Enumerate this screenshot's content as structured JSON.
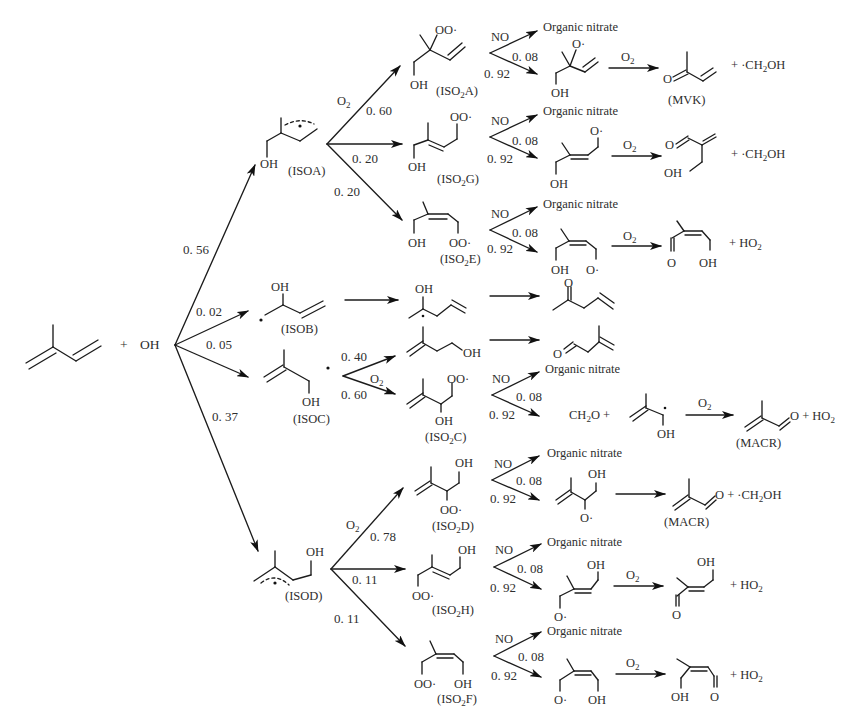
{
  "diagram": {
    "reactants": {
      "isoprene": "isoprene",
      "plus": "+",
      "oxidant": "OH"
    },
    "first_branch": [
      {
        "label": "ISOA",
        "yield": "0.56"
      },
      {
        "label": "ISOB",
        "yield": "0.02"
      },
      {
        "label": "ISOC",
        "yield": "0.05"
      },
      {
        "label": "ISOD",
        "yield": "0.37"
      }
    ],
    "isoa_branch": {
      "reagent": "O2",
      "paths": [
        {
          "peroxy": "ISO2A",
          "yield": "0.60"
        },
        {
          "peroxy": "ISO2G",
          "yield": "0.20"
        },
        {
          "peroxy": "ISO2E",
          "yield": "0.20"
        }
      ]
    },
    "isoc_branch": {
      "reagent": "O2",
      "paths": [
        {
          "product": "3-methyl-3-buten-1-ol-like aldehyde route",
          "yield": "0.40"
        },
        {
          "peroxy": "ISO2C",
          "yield": "0.60"
        }
      ]
    },
    "isod_branch": {
      "reagent": "O2",
      "paths": [
        {
          "peroxy": "ISO2D",
          "yield": "0.78"
        },
        {
          "peroxy": "ISO2H",
          "yield": "0.11"
        },
        {
          "peroxy": "ISO2F",
          "yield": "0.11"
        }
      ]
    },
    "no_step": {
      "reagent": "NO",
      "nitrate_label": "Organic nitrate",
      "nitrate_yield": "0.08",
      "alkoxy_yield": "0.92"
    },
    "labels": {
      "isoa": "(ISOA)",
      "isob": "(ISOB)",
      "isoc": "(ISOC)",
      "isod": "(ISOD)",
      "iso2a": "(ISO",
      "iso2a_tail": "A)",
      "iso2g_tail": "G)",
      "iso2e_tail": "E)",
      "iso2c_tail": "C)",
      "iso2d_tail": "D)",
      "iso2h_tail": "H)",
      "iso2f_tail": "F)",
      "mvk": "(MVK)",
      "macr": "(MACR)",
      "macr2": "(MACR)",
      "sub2": "2",
      "o2": "O",
      "oh": "OH",
      "oo_dot": "OO·",
      "o_dot": "O·",
      "o": "O",
      "ch2oh_radical": "+ ·CH",
      "ch2oh_tail": "OH",
      "ho2": "+ HO",
      "ho2b": "+  HO",
      "ch2o": "CH",
      "ch2o_tail": "O +",
      "plus_o_ho2": "O + HO",
      "plus_ch2oh_macr": "O + ·CH",
      "no": "NO",
      "organic_nitrate": "Organic nitrate",
      "y008": "0. 08",
      "y092": "0. 92",
      "y056": "0. 56",
      "y002": "0. 02",
      "y005": "0. 05",
      "y037": "0. 37",
      "y060": "0. 60",
      "y020a": "0. 20",
      "y020b": "0. 20",
      "y040": "0. 40",
      "y060c": "0. 60",
      "y078": "0. 78",
      "y011a": "0. 11",
      "y011b": "0. 11",
      "plus": "+",
      "oh_reactant": "OH"
    },
    "final_products": [
      {
        "from": "ISO2A",
        "products": [
          "MVK",
          "·CH2OH"
        ]
      },
      {
        "from": "ISO2G",
        "products": [
          "hydroxy-methacrolein isomer",
          "·CH2OH"
        ]
      },
      {
        "from": "ISO2E",
        "products": [
          "hydroxy-unsaturated carbonyl",
          "HO2"
        ]
      },
      {
        "from": "ISOB",
        "products": [
          "4-penten-2-one-like ketone"
        ]
      },
      {
        "from": "ISOC (0.40)",
        "products": [
          "3-methyl-3-butenal"
        ]
      },
      {
        "from": "ISO2C",
        "products": [
          "CH2O",
          "hydroxy radical",
          "MACR",
          "HO2"
        ]
      },
      {
        "from": "ISO2D",
        "products": [
          "MACR",
          "·CH2OH"
        ]
      },
      {
        "from": "ISO2H",
        "products": [
          "hydroxy-unsaturated aldehyde",
          "HO2"
        ]
      },
      {
        "from": "ISO2F",
        "products": [
          "hydroxy-unsaturated aldehyde",
          "HO2"
        ]
      }
    ]
  }
}
